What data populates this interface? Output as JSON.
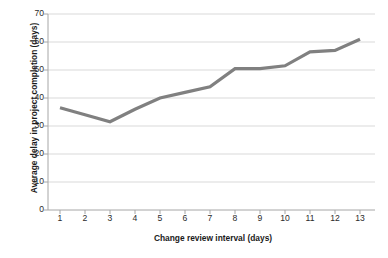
{
  "chart_data": {
    "type": "line",
    "title": "",
    "xlabel": "Change review interval (days)",
    "ylabel": "Average delay in project completion (days)",
    "x": [
      1,
      2,
      3,
      4,
      5,
      6,
      7,
      8,
      9,
      10,
      11,
      12,
      13
    ],
    "categories": [
      "1",
      "2",
      "3",
      "4",
      "5",
      "6",
      "7",
      "8",
      "9",
      "10",
      "11",
      "12",
      "13"
    ],
    "values": [
      36.5,
      34.0,
      31.5,
      36.0,
      40.0,
      42.0,
      44.0,
      50.5,
      50.5,
      51.5,
      56.5,
      57.0,
      61.0
    ],
    "series": [
      {
        "name": "Average delay",
        "values": [
          36.5,
          34.0,
          31.5,
          36.0,
          40.0,
          42.0,
          44.0,
          50.5,
          50.5,
          51.5,
          56.5,
          57.0,
          61.0
        ]
      }
    ],
    "xlim": [
      1,
      13
    ],
    "ylim": [
      0,
      70
    ],
    "ytick_labels": [
      "0",
      "10",
      "20",
      "30",
      "40",
      "50",
      "60",
      "70"
    ],
    "ytick_values": [
      0,
      10,
      20,
      30,
      40,
      50,
      60,
      70
    ],
    "grid": "horizontal",
    "legend": "none",
    "line_color": "#808080",
    "axis_color": "#a6a6a6",
    "grid_color": "#d9d9d9",
    "text_color": "#1a1a1a",
    "background": "#ffffff"
  }
}
